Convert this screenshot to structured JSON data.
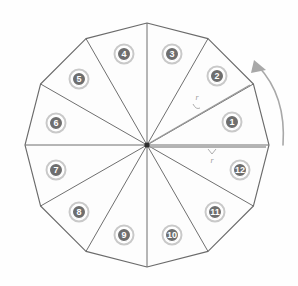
{
  "figure": {
    "shape": "12-sided regular polygon (dodecagon)",
    "center": {
      "x": 147,
      "y": 145
    },
    "radius": 122,
    "colors": {
      "background": "#fefefe",
      "outline": "#6b6b6b",
      "spoke": "#6f6f6f",
      "badge_fill": "#6e6e6e",
      "badge_ring": "#c9c9c9",
      "badge_text": "#ffffff",
      "radius_line": "#9a9a9a",
      "arrow": "#a8a8a8"
    }
  },
  "sectors": [
    {
      "id": 1,
      "label": "1",
      "cx": 232,
      "cy": 122
    },
    {
      "id": 2,
      "label": "2",
      "cx": 217,
      "cy": 76
    },
    {
      "id": 3,
      "label": "3",
      "cx": 172,
      "cy": 54
    },
    {
      "id": 4,
      "label": "4",
      "cx": 124,
      "cy": 54
    },
    {
      "id": 5,
      "label": "5",
      "cx": 79,
      "cy": 79
    },
    {
      "id": 6,
      "label": "6",
      "cx": 56,
      "cy": 123
    },
    {
      "id": 7,
      "label": "7",
      "cx": 56,
      "cy": 170
    },
    {
      "id": 8,
      "label": "8",
      "cx": 79,
      "cy": 212
    },
    {
      "id": 9,
      "label": "9",
      "cx": 124,
      "cy": 235
    },
    {
      "id": 10,
      "label": "10",
      "cx": 172,
      "cy": 235
    },
    {
      "id": 11,
      "label": "11",
      "cx": 215,
      "cy": 212
    },
    {
      "id": 12,
      "label": "12",
      "cx": 240,
      "cy": 170
    }
  ],
  "annotations": {
    "radius_label_upper": {
      "text": "r",
      "x": 197,
      "y": 100
    },
    "radius_label_lower": {
      "text": "r",
      "x": 212,
      "y": 158
    },
    "rotation_arrow": {
      "name": "counterclockwise-arrow",
      "direction": "counterclockwise"
    }
  }
}
